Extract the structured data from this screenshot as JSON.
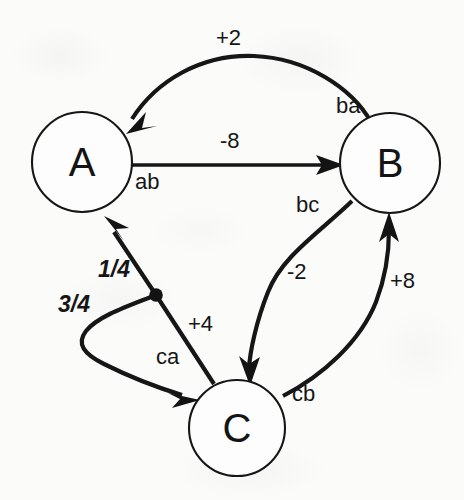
{
  "diagram": {
    "type": "state-transition-graph",
    "title": "",
    "background_color": "#fbfbfa",
    "stroke_color": "#161616",
    "nodes": [
      {
        "id": "A",
        "label": "A",
        "cx": 82,
        "cy": 162,
        "r": 50
      },
      {
        "id": "B",
        "label": "B",
        "cx": 390,
        "cy": 163,
        "r": 50
      },
      {
        "id": "C",
        "label": "C",
        "cx": 237,
        "cy": 428,
        "r": 48
      }
    ],
    "edges": [
      {
        "id": "ba",
        "name_label": "ba",
        "weight_label": "+2",
        "from": "B",
        "to": "A",
        "style": "curved-arc-top"
      },
      {
        "id": "ab",
        "name_label": "ab",
        "weight_label": "-8",
        "from": "A",
        "to": "B",
        "style": "straight"
      },
      {
        "id": "bc",
        "name_label": "bc",
        "weight_label": "-2",
        "from": "B",
        "to": "C",
        "style": "curved"
      },
      {
        "id": "cb",
        "name_label": "cb",
        "weight_label": "+8",
        "from": "C",
        "to": "B",
        "style": "curved"
      },
      {
        "id": "ca",
        "name_label": "ca",
        "weight_label": "+4",
        "from": "C",
        "to": "A",
        "style": "branching-with-junction"
      }
    ],
    "branch_probabilities": [
      {
        "id": "ca-to-a",
        "label": "1/4",
        "style": "italic-bold"
      },
      {
        "id": "ca-to-c",
        "label": "3/4",
        "style": "italic-bold"
      }
    ],
    "junction": {
      "x": 156,
      "y": 295,
      "r": 6.5
    },
    "labels": {
      "node_a": "A",
      "node_b": "B",
      "node_c": "C",
      "ba_name": "ba",
      "ba_weight": "+2",
      "ab_name": "ab",
      "ab_weight": "-8",
      "bc_name": "bc",
      "bc_weight": "-2",
      "cb_name": "cb",
      "cb_weight": "+8",
      "ca_name": "ca",
      "ca_weight": "+4",
      "prob_quarter": "1/4",
      "prob_three_quarter": "3/4"
    }
  }
}
